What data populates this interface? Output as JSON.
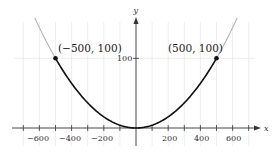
{
  "chart_data": {
    "type": "line",
    "title": "",
    "xlabel": "x",
    "ylabel": "y",
    "function": "y = x^2 / 2500",
    "xlim": [
      -750,
      750
    ],
    "ylim": [
      0,
      150
    ],
    "grid": true,
    "x_ticks": [
      -600,
      -400,
      -200,
      200,
      400,
      600
    ],
    "x_tick_labels": [
      "−600",
      "−400",
      "−200",
      "200",
      "400",
      "600"
    ],
    "y_ticks": [
      100
    ],
    "y_tick_labels": [
      "100"
    ],
    "series": [
      {
        "name": "parabola (highlighted segment)",
        "color": "#111111",
        "x": [
          -500,
          -400,
          -300,
          -200,
          -100,
          0,
          100,
          200,
          300,
          400,
          500
        ],
        "y": [
          100,
          64,
          36,
          16,
          4,
          0,
          4,
          16,
          36,
          64,
          100
        ]
      },
      {
        "name": "parabola (extension)",
        "color": "#b5b5b5",
        "x": [
          -620,
          -500,
          500,
          620
        ],
        "y": [
          153.8,
          100,
          100,
          153.8
        ]
      }
    ],
    "points": [
      {
        "x": -500,
        "y": 100,
        "label": "(−500, 100)"
      },
      {
        "x": 500,
        "y": 100,
        "label": "(500, 100)"
      }
    ]
  },
  "labels": {
    "x_axis": "x",
    "y_axis": "y",
    "y_tick_100": "100",
    "point_left": "(−500, 100)",
    "point_right": "(500, 100)",
    "x_ticks": [
      "−600",
      "−400",
      "−200",
      "200",
      "400",
      "600"
    ]
  },
  "colors": {
    "curve": "#111111",
    "extension": "#b5b5b5",
    "grid": "#e6e6e6",
    "axis": "#333333"
  }
}
